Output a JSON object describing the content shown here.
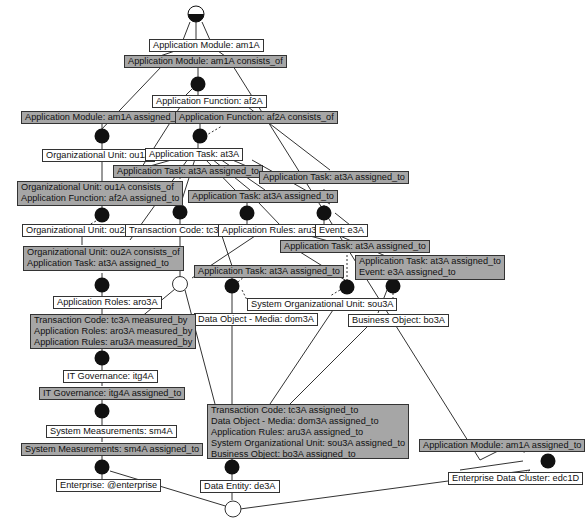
{
  "diagram": {
    "type": "relationship-graph",
    "colors": {
      "object_fill": "#ffffff",
      "relation_fill": "#a6a6a6",
      "junction_fill": "#111111",
      "border": "#333333"
    },
    "root_node": {
      "label": "",
      "shape": "half-filled-circle"
    },
    "objects": {
      "am1A": "Application Module: am1A",
      "af2A": "Application Function: af2A",
      "ou1A": "Organizational Unit: ou1A",
      "at3A": "Application Task: at3A",
      "ou2A": "Organizational Unit: ou2A",
      "tc3A": "Transaction Code: tc3A",
      "aru3A": "Application Rules: aru3A",
      "e3A": "Event: e3A",
      "aro3A": "Application Roles: aro3A",
      "sou3A": "System Organizational Unit: sou3A",
      "dom3A": "Data Object - Media: dom3A",
      "bo3A": "Business Object: bo3A",
      "itg4A": "IT Governance: itg4A",
      "sm4A": "System Measurements: sm4A",
      "enterprise": "Enterprise: @enterprise",
      "de3A": "Data Entity: de3A",
      "edc1D": "Enterprise Data Cluster: edc1D"
    },
    "relations": {
      "r1": [
        "Application Module: am1A consists_of"
      ],
      "r2": [
        "Application Module: am1A assigned_to"
      ],
      "r3": [
        "Application Function: af2A consists_of"
      ],
      "r4": [
        "Application Task: at3A assigned_to"
      ],
      "r5": [
        "Application Task: at3A assigned_to"
      ],
      "r6": [
        "Organizational Unit: ou1A consists_of",
        "Application Function: af2A assigned_to"
      ],
      "r7": [
        "Application Task: at3A assigned_to"
      ],
      "r8": [
        "Application Task: at3A assigned_to"
      ],
      "r9": [
        "Organizational Unit: ou2A consists_of",
        "Application Task: at3A assigned_to"
      ],
      "r10": [
        "Application Task: at3A assigned_to"
      ],
      "r11": [
        "Application Task: at3A assigned_to",
        "Event: e3A assigned_to"
      ],
      "r12": [
        "Transaction Code: tc3A measured_by",
        "Application Roles: aro3A measured_by",
        "Application Rules: aru3A measured_by"
      ],
      "r13": [
        "IT Governance: itg4A assigned_to"
      ],
      "r14": [
        "Transaction Code: tc3A assigned_to",
        "Data Object - Media: dom3A assigned_to",
        "Application Rules: aru3A assigned_to",
        "System Organizational Unit: sou3A assigned_to",
        "Business Object: bo3A assigned_to"
      ],
      "r15": [
        "System Measurements: sm4A assigned_to"
      ],
      "r16": [
        "Application Module: am1A assigned_to"
      ]
    }
  }
}
